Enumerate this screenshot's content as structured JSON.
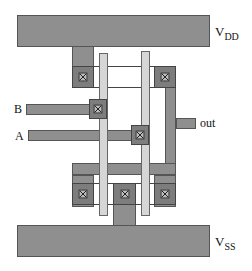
{
  "diagram": {
    "type": "CMOS NAND2 stick/layout diagram",
    "labels": {
      "vdd_main": "V",
      "vdd_sub": "DD",
      "vss_main": "V",
      "vss_sub": "SS",
      "input_b": "B",
      "input_a": "A",
      "output": "out"
    },
    "colors": {
      "metal": "#8f8f8f",
      "poly": "#d6d6d6",
      "contact": "#7d7d7d",
      "outline": "#444444",
      "background": "#ffffff"
    }
  }
}
